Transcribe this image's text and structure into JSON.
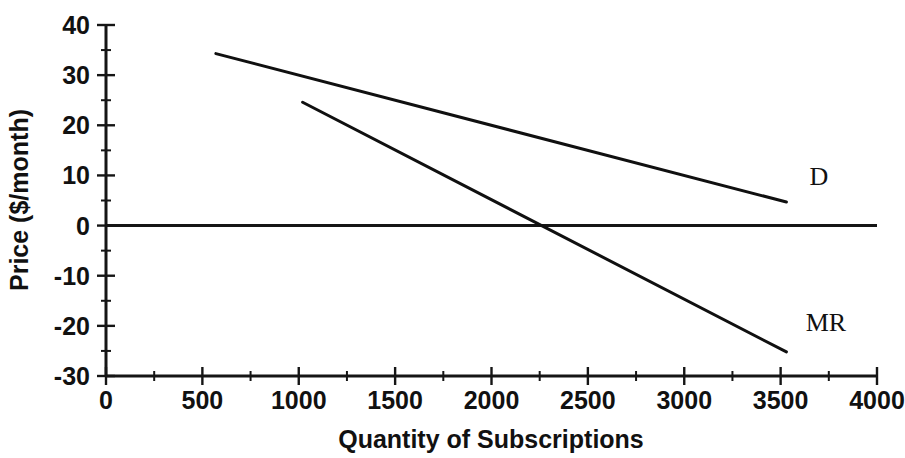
{
  "chart_data": {
    "type": "line",
    "title": "",
    "xlabel": "Quantity of Subscriptions",
    "ylabel": "Price ($/month)",
    "xlim": [
      0,
      4000
    ],
    "ylim": [
      -30,
      40
    ],
    "grid": false,
    "legend_position": "inline-right-of-line-end",
    "x_major_ticks": [
      0,
      500,
      1000,
      1500,
      2000,
      2500,
      3000,
      3500,
      4000
    ],
    "x_tick_labels": [
      "0",
      "500",
      "1000",
      "1500",
      "2000",
      "2500",
      "3000",
      "3500",
      "4000"
    ],
    "x_minor_ticks": [
      250,
      750,
      1250,
      1750,
      2250,
      2750,
      3250,
      3750
    ],
    "y_major_ticks": [
      -30,
      -20,
      -10,
      0,
      10,
      20,
      30,
      40
    ],
    "y_tick_labels": [
      "-30",
      "-20",
      "-10",
      "0",
      "10",
      "20",
      "30",
      "40"
    ],
    "y_minor_ticks": [
      -25,
      -15,
      -5,
      5,
      15,
      25,
      35
    ],
    "zero_line": {
      "y": 0,
      "x_start": 0,
      "x_end": 4000
    },
    "series": [
      {
        "name": "D",
        "label": "D",
        "label_point": [
          3650,
          8
        ],
        "points": [
          {
            "x": 570,
            "y": 34.3
          },
          {
            "x": 3530,
            "y": 4.7
          }
        ],
        "intercept": 40,
        "slope": -0.01
      },
      {
        "name": "MR",
        "label": "MR",
        "label_point": [
          3630,
          -21
        ],
        "points": [
          {
            "x": 1020,
            "y": 24.6
          },
          {
            "x": 3530,
            "y": -25.2
          }
        ],
        "intercept": 45,
        "slope": -0.02
      }
    ],
    "annotations": []
  },
  "colors": {
    "ink": "#111111",
    "background": "#ffffff"
  }
}
